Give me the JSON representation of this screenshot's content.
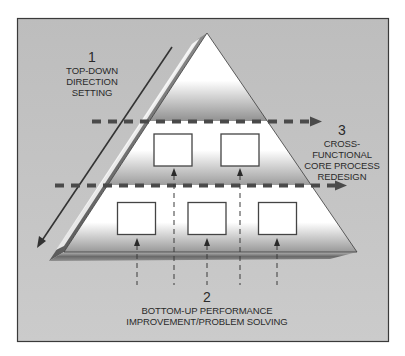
{
  "diagram": {
    "type": "pyramid",
    "colors": {
      "background": "#c3c3c3",
      "frame_border": "#3a3a3a",
      "pyramid_face": "#ffffff",
      "pyramid_side": "#6e6e6e",
      "dash": "#4a4a4a",
      "text": "#2a2a2a"
    },
    "labels": {
      "top_down": {
        "number": "1",
        "lines": [
          "TOP-DOWN",
          "DIRECTION",
          "SETTING"
        ]
      },
      "bottom_up": {
        "number": "2",
        "lines": [
          "BOTTOM-UP PERFORMANCE",
          "IMPROVEMENT/PROBLEM SOLVING"
        ]
      },
      "cross_functional": {
        "number": "3",
        "lines": [
          "CROSS-FUNCTIONAL",
          "CORE PROCESS",
          "REDESIGN"
        ]
      }
    },
    "tiers": {
      "upper_boxes": 2,
      "lower_boxes": 3
    },
    "arrows": {
      "top_down": "diagonal-arrow-down-left",
      "bottom_up": "vertical-dashed-arrows-up",
      "cross_functional": "horizontal-dashed-arrows-right"
    }
  }
}
